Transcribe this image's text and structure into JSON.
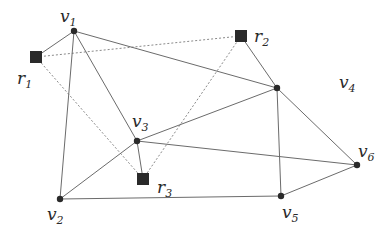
{
  "diagram": {
    "title": "",
    "colors": {
      "edge": "#6b6b6b",
      "dashed_edge": "#8a8a8a",
      "node": "#2a2a2a",
      "background": "#ffffff"
    },
    "vertices": [
      {
        "id": "v1",
        "base": "v",
        "sub": "1",
        "x": 74,
        "y": 31,
        "lx": 60,
        "ly": 22
      },
      {
        "id": "v2",
        "base": "v",
        "sub": "2",
        "x": 60,
        "y": 199,
        "lx": 47,
        "ly": 220
      },
      {
        "id": "v3",
        "base": "v",
        "sub": "3",
        "x": 137,
        "y": 141,
        "lx": 132,
        "ly": 127
      },
      {
        "id": "v4",
        "base": "v",
        "sub": "4",
        "x": 277,
        "y": 88,
        "lx": 339,
        "ly": 88
      },
      {
        "id": "v5",
        "base": "v",
        "sub": "5",
        "x": 281,
        "y": 196,
        "lx": 282,
        "ly": 218
      },
      {
        "id": "v6",
        "base": "v",
        "sub": "6",
        "x": 357,
        "y": 165,
        "lx": 358,
        "ly": 157
      }
    ],
    "robots": [
      {
        "id": "r1",
        "base": "r",
        "sub": "1",
        "x": 36,
        "y": 57,
        "lx": 17,
        "ly": 84
      },
      {
        "id": "r2",
        "base": "r",
        "sub": "2",
        "x": 241,
        "y": 36,
        "lx": 254,
        "ly": 42
      },
      {
        "id": "r3",
        "base": "r",
        "sub": "3",
        "x": 143,
        "y": 179,
        "lx": 157,
        "ly": 193
      }
    ],
    "edges": [
      [
        "v1",
        "v2"
      ],
      [
        "v1",
        "v3"
      ],
      [
        "v1",
        "v4"
      ],
      [
        "v2",
        "v3"
      ],
      [
        "v2",
        "v5"
      ],
      [
        "v3",
        "v4"
      ],
      [
        "v3",
        "v6"
      ],
      [
        "v4",
        "v5"
      ],
      [
        "v4",
        "v6"
      ],
      [
        "v5",
        "v6"
      ]
    ],
    "robot_edges": [
      [
        "r1",
        "v1"
      ],
      [
        "r2",
        "v4"
      ],
      [
        "r3",
        "v3"
      ]
    ],
    "dashed_edges": [
      [
        "r1",
        "r2"
      ],
      [
        "r1",
        "r3"
      ],
      [
        "r2",
        "r3"
      ]
    ]
  }
}
